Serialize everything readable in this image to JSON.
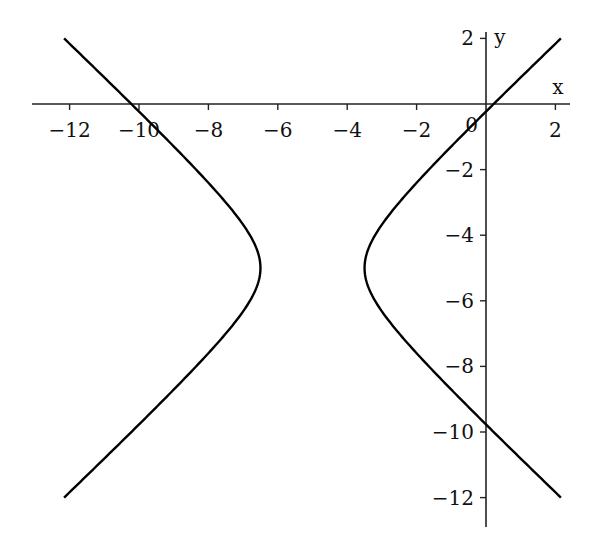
{
  "chart_data": {
    "type": "line",
    "title": "",
    "xlabel": "x",
    "ylabel": "y",
    "origin_label": "0",
    "xlim": [
      -13.2,
      2.4
    ],
    "ylim": [
      -12.9,
      2.4
    ],
    "xticks": [
      -12,
      -10,
      -8,
      -6,
      -4,
      -2,
      2
    ],
    "xtick_labels": [
      "−12",
      "−10",
      "−8",
      "−6",
      "−4",
      "−2",
      "2"
    ],
    "yticks": [
      2,
      -2,
      -4,
      -6,
      -8,
      -10,
      -12
    ],
    "ytick_labels": [
      "2",
      "−2",
      "−4",
      "−6",
      "−8",
      "−10",
      "−12"
    ],
    "grid": false,
    "legend": null,
    "series": [
      {
        "name": "hyperbola (x+5)^2 - (y+5)^2 = 2.25",
        "equation": "(x+5)^2 - (y+5)^2 = 2.25",
        "center": [
          -5,
          -5
        ],
        "a": 1.5,
        "b": 1.5,
        "vertices": [
          [
            -6.5,
            -5
          ],
          [
            -3.5,
            -5
          ]
        ],
        "y_range": [
          -12,
          2
        ],
        "color": "#000000"
      }
    ]
  }
}
